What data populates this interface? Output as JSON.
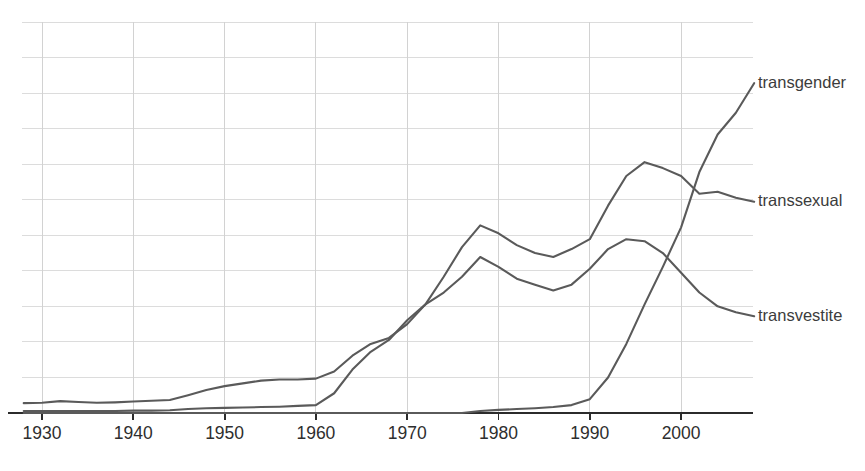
{
  "chart_data": {
    "type": "line",
    "title": "",
    "subtitle": "",
    "xlabel": "",
    "ylabel": "",
    "xlim": [
      1928,
      2008
    ],
    "ylim": [
      0,
      1.0
    ],
    "grid": true,
    "gridlines_horizontal": 12,
    "legend_position": "inline-right",
    "line_color": "#5a5a5a",
    "gridline_color": "#dcdcdc",
    "axis_color": "#2b2b2b",
    "background_color": "#ffffff",
    "x_ticks": [
      "1930",
      "1940",
      "1950",
      "1960",
      "1970",
      "1980",
      "1990",
      "2000"
    ],
    "x_tick_values": [
      1930,
      1940,
      1950,
      1960,
      1970,
      1980,
      1990,
      2000
    ],
    "y_tick_labels": [],
    "x": [
      1928,
      1930,
      1932,
      1934,
      1936,
      1938,
      1940,
      1942,
      1944,
      1946,
      1948,
      1950,
      1952,
      1954,
      1956,
      1958,
      1960,
      1962,
      1964,
      1966,
      1968,
      1970,
      1972,
      1974,
      1976,
      1978,
      1980,
      1982,
      1984,
      1986,
      1988,
      1990,
      1992,
      1994,
      1996,
      1998,
      2000,
      2002,
      2004,
      2006,
      2008
    ],
    "series": [
      {
        "name": "transgender",
        "label": "transgender",
        "values": [
          0.0,
          0.0,
          0.0,
          0.0,
          0.0,
          0.0,
          0.0,
          0.0,
          0.0,
          0.0,
          0.0,
          0.0,
          0.0,
          0.0,
          0.0,
          0.0,
          0.0,
          0.0,
          0.0,
          0.0,
          0.0,
          0.0,
          0.0,
          0.0,
          0.0,
          0.005,
          0.008,
          0.01,
          0.012,
          0.015,
          0.02,
          0.035,
          0.09,
          0.175,
          0.275,
          0.37,
          0.47,
          0.61,
          0.705,
          0.76,
          0.835
        ]
      },
      {
        "name": "transsexual",
        "label": "transsexual",
        "values": [
          0.005,
          0.005,
          0.005,
          0.005,
          0.005,
          0.005,
          0.006,
          0.006,
          0.007,
          0.01,
          0.012,
          0.013,
          0.014,
          0.015,
          0.016,
          0.018,
          0.02,
          0.05,
          0.11,
          0.155,
          0.185,
          0.235,
          0.275,
          0.345,
          0.42,
          0.475,
          0.455,
          0.425,
          0.405,
          0.395,
          0.415,
          0.44,
          0.525,
          0.6,
          0.635,
          0.62,
          0.6,
          0.555,
          0.56,
          0.545,
          0.535
        ]
      },
      {
        "name": "transvestite",
        "label": "transvestite",
        "values": [
          0.025,
          0.026,
          0.03,
          0.028,
          0.026,
          0.027,
          0.029,
          0.031,
          0.033,
          0.045,
          0.058,
          0.068,
          0.075,
          0.082,
          0.085,
          0.085,
          0.087,
          0.105,
          0.145,
          0.175,
          0.19,
          0.225,
          0.275,
          0.305,
          0.345,
          0.395,
          0.37,
          0.34,
          0.325,
          0.31,
          0.325,
          0.365,
          0.415,
          0.44,
          0.435,
          0.405,
          0.355,
          0.305,
          0.27,
          0.255,
          0.245
        ]
      }
    ],
    "annotations": []
  }
}
